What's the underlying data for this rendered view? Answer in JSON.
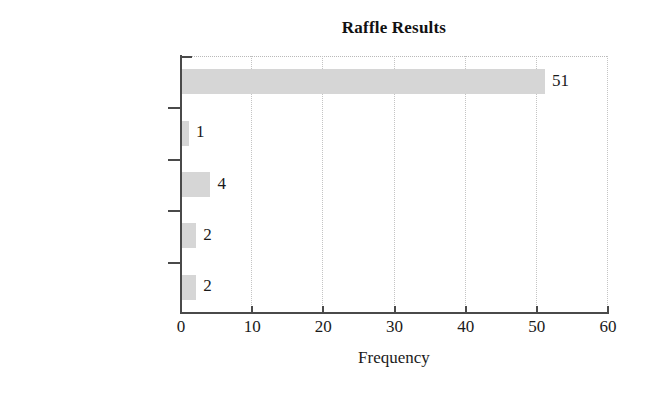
{
  "chart_data": {
    "type": "bar",
    "orientation": "horizontal",
    "title": "Raffle Results",
    "xlabel": "Frequency",
    "ylabel": "",
    "categories": [
      "Nothing",
      "TV set",
      "Bottle of wine",
      "Fruit basket",
      "$5 coupon"
    ],
    "values": [
      51,
      1,
      4,
      2,
      2
    ],
    "value_labels": [
      "51",
      "1",
      "4",
      "2",
      "2"
    ],
    "xlim": [
      0,
      60
    ],
    "xticks": [
      0,
      10,
      20,
      30,
      40,
      50,
      60
    ],
    "xtick_labels": [
      "0",
      "10",
      "20",
      "30",
      "40",
      "50",
      "60"
    ],
    "grid": "vertical-dotted",
    "legend": "none",
    "bar_color": "#d6d6d6",
    "axis_color": "#4a4a4a",
    "text_color": "#1a1a1a",
    "background": "#ffffff"
  }
}
